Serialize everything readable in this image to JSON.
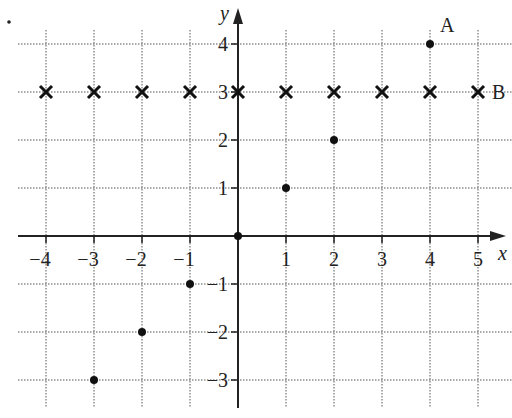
{
  "chart_data": {
    "type": "scatter",
    "title": "",
    "xlabel": "x",
    "ylabel": "y",
    "xlim": [
      -4.5,
      5.5
    ],
    "ylim": [
      -3.3,
      4.4
    ],
    "xticks": [
      -4,
      -3,
      -2,
      -1,
      1,
      2,
      3,
      4,
      5
    ],
    "yticks": [
      -3,
      -2,
      -1,
      1,
      2,
      3,
      4
    ],
    "xtick_labels": [
      "−4",
      "−3",
      "−2",
      "−1",
      "1",
      "2",
      "3",
      "4",
      "5"
    ],
    "ytick_labels": [
      "−3",
      "−2",
      "−1",
      "1",
      "2",
      "3",
      "4"
    ],
    "grid": true,
    "series": [
      {
        "name": "dots",
        "marker": "circle",
        "points": [
          [
            -3,
            -3
          ],
          [
            -2,
            -2
          ],
          [
            -1,
            -1
          ],
          [
            0,
            0
          ],
          [
            1,
            1
          ],
          [
            2,
            2
          ],
          [
            4,
            4
          ]
        ]
      },
      {
        "name": "B",
        "marker": "x",
        "points": [
          [
            -4,
            3
          ],
          [
            -3,
            3
          ],
          [
            -2,
            3
          ],
          [
            -1,
            3
          ],
          [
            0,
            3
          ],
          [
            1,
            3
          ],
          [
            2,
            3
          ],
          [
            3,
            3
          ],
          [
            4,
            3
          ],
          [
            5,
            3
          ]
        ]
      }
    ],
    "annotations": [
      {
        "text": "A",
        "at": [
          4,
          4
        ]
      },
      {
        "text": "B",
        "at": [
          5,
          3
        ]
      }
    ],
    "stray_dot": {
      "px": [
        9,
        22
      ]
    }
  }
}
